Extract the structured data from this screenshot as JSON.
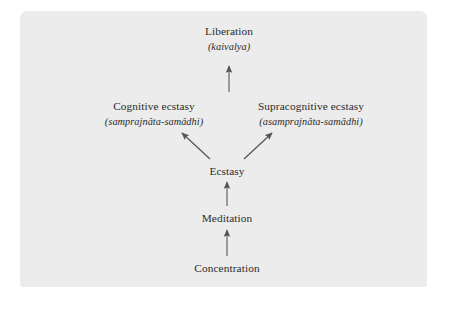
{
  "diagram": {
    "nodes": [
      {
        "id": "liberation",
        "label": "Liberation",
        "sublabel": "(kaivalya)"
      },
      {
        "id": "cognitive",
        "label": "Cognitive ecstasy",
        "sublabel": "(samprajnâta-samâdhi)"
      },
      {
        "id": "supracognitive",
        "label": "Supracognitive ecstasy",
        "sublabel": "(asamprajnâta-samâdhi)"
      },
      {
        "id": "ecstasy",
        "label": "Ecstasy",
        "sublabel": ""
      },
      {
        "id": "meditation",
        "label": "Meditation",
        "sublabel": ""
      },
      {
        "id": "concentration",
        "label": "Concentration",
        "sublabel": ""
      }
    ],
    "arrows": [
      {
        "name": "arrow-concentration-to-meditation",
        "from": "concentration",
        "to": "meditation"
      },
      {
        "name": "arrow-meditation-to-ecstasy",
        "from": "meditation",
        "to": "ecstasy"
      },
      {
        "name": "arrow-ecstasy-to-cognitive",
        "from": "ecstasy",
        "to": "cognitive"
      },
      {
        "name": "arrow-ecstasy-to-supracognitive",
        "from": "ecstasy",
        "to": "supracognitive"
      },
      {
        "name": "arrow-to-liberation",
        "from": "supracognitive",
        "to": "liberation"
      }
    ],
    "colors": {
      "panel_background": "#ececec",
      "page_background": "#ffffff",
      "text": "#2b2b2b",
      "arrow": "#555555"
    }
  }
}
